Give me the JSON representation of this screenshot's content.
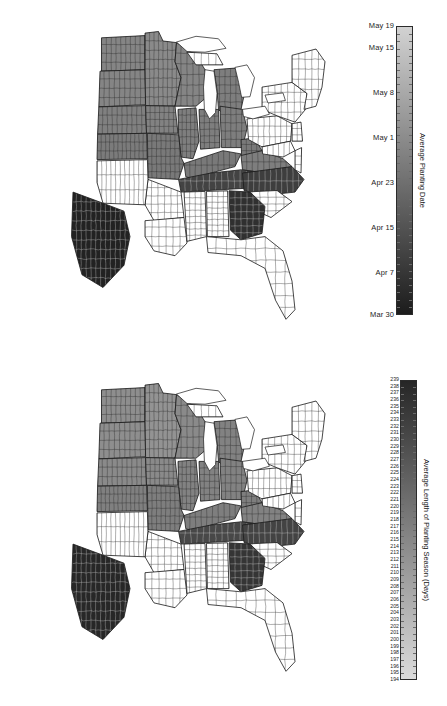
{
  "figure": {
    "background": "#ffffff"
  },
  "panels": [
    {
      "id": "average-planting-date",
      "colorbar": {
        "title": "Average Planting Date",
        "orientation": "vertical",
        "labels": [
          "May 19",
          "May 15",
          "May 8",
          "May 1",
          "Apr 23",
          "Apr 15",
          "Apr 7",
          "Mar 30"
        ],
        "label_positions_pct": [
          0,
          7.6,
          23.2,
          38.7,
          54.3,
          69.9,
          85.5,
          100
        ],
        "top_color": "#d2d2d2",
        "bottom_color": "#1c1c1c",
        "gradient_direction": "light-top-to-dark-bottom",
        "tick_count": 40
      }
    },
    {
      "id": "average-length-of-planting-season",
      "colorbar": {
        "title": "Average Length of Planting Season (Days)",
        "orientation": "vertical",
        "labels": [
          "239",
          "238",
          "237",
          "236",
          "235",
          "234",
          "233",
          "232",
          "231",
          "230",
          "229",
          "228",
          "227",
          "226",
          "225",
          "224",
          "223",
          "222",
          "221",
          "220",
          "219",
          "218",
          "217",
          "216",
          "215",
          "214",
          "213",
          "212",
          "211",
          "210",
          "209",
          "208",
          "207",
          "206",
          "205",
          "204",
          "203",
          "202",
          "201",
          "200",
          "199",
          "198",
          "197",
          "196",
          "195",
          "194"
        ],
        "top_color": "#262626",
        "bottom_color": "#dcdcdc",
        "gradient_direction": "dark-top-to-light-bottom",
        "tick_count": 46
      }
    }
  ],
  "chart_data": {
    "type": "heatmap",
    "title": "",
    "subtitle": "",
    "maps": [
      {
        "name": "Average Planting Date",
        "legend_label": "Average Planting Date",
        "value_type": "date",
        "scale_min_label": "Mar 30",
        "scale_max_label": "May 19",
        "scale_min_color": "#1c1c1c",
        "scale_max_color": "#d2d2d2",
        "tick_labels": [
          "May 19",
          "May 15",
          "May 8",
          "May 1",
          "Apr 23",
          "Apr 15",
          "Apr 7",
          "Mar 30"
        ],
        "regions": [
          {
            "name": "North Dakota",
            "shade": 0.52
          },
          {
            "name": "South Dakota",
            "shade": 0.52
          },
          {
            "name": "Minnesota",
            "shade": 0.5
          },
          {
            "name": "Wisconsin",
            "shade": 0.52
          },
          {
            "name": "Michigan",
            "shade": 0.55
          },
          {
            "name": "Nebraska",
            "shade": 0.54
          },
          {
            "name": "Iowa",
            "shade": 0.53
          },
          {
            "name": "Illinois",
            "shade": 0.55
          },
          {
            "name": "Indiana",
            "shade": 0.55
          },
          {
            "name": "Ohio",
            "shade": 0.55
          },
          {
            "name": "Kansas",
            "shade": 0.56
          },
          {
            "name": "Missouri",
            "shade": 0.57
          },
          {
            "name": "Kentucky",
            "shade": 0.57
          },
          {
            "name": "West Virginia",
            "shade": 0.57
          },
          {
            "name": "Pennsylvania",
            "shade": 0.0
          },
          {
            "name": "New York",
            "shade": 0.0
          },
          {
            "name": "New England",
            "shade": 0.0
          },
          {
            "name": "Virginia",
            "shade": 0.55
          },
          {
            "name": "North Carolina",
            "shade": 0.82
          },
          {
            "name": "Tennessee",
            "shade": 0.8
          },
          {
            "name": "Arkansas",
            "shade": 0.0
          },
          {
            "name": "Oklahoma",
            "shade": 0.0
          },
          {
            "name": "Texas",
            "shade": 0.94
          },
          {
            "name": "Louisiana",
            "shade": 0.0
          },
          {
            "name": "Mississippi",
            "shade": 0.0
          },
          {
            "name": "Alabama",
            "shade": 0.0
          },
          {
            "name": "Georgia",
            "shade": 0.88
          },
          {
            "name": "South Carolina",
            "shade": 0.0
          },
          {
            "name": "Florida",
            "shade": 0.0
          }
        ]
      },
      {
        "name": "Average Length of Planting Season (Days)",
        "legend_label": "Average Length of Planting Season (Days)",
        "value_type": "days",
        "scale_min_label": "194",
        "scale_max_label": "239",
        "scale_min_color": "#dcdcdc",
        "scale_max_color": "#262626",
        "tick_labels": [
          "239",
          "194"
        ],
        "regions": [
          {
            "name": "North Dakota",
            "shade": 0.48
          },
          {
            "name": "South Dakota",
            "shade": 0.48
          },
          {
            "name": "Minnesota",
            "shade": 0.46
          },
          {
            "name": "Wisconsin",
            "shade": 0.5
          },
          {
            "name": "Michigan",
            "shade": 0.53
          },
          {
            "name": "Nebraska",
            "shade": 0.5
          },
          {
            "name": "Iowa",
            "shade": 0.5
          },
          {
            "name": "Illinois",
            "shade": 0.53
          },
          {
            "name": "Indiana",
            "shade": 0.53
          },
          {
            "name": "Ohio",
            "shade": 0.53
          },
          {
            "name": "Kansas",
            "shade": 0.54
          },
          {
            "name": "Missouri",
            "shade": 0.55
          },
          {
            "name": "Kentucky",
            "shade": 0.55
          },
          {
            "name": "West Virginia",
            "shade": 0.55
          },
          {
            "name": "Pennsylvania",
            "shade": 0.0
          },
          {
            "name": "New York",
            "shade": 0.0
          },
          {
            "name": "New England",
            "shade": 0.0
          },
          {
            "name": "Virginia",
            "shade": 0.53
          },
          {
            "name": "North Carolina",
            "shade": 0.8
          },
          {
            "name": "Tennessee",
            "shade": 0.78
          },
          {
            "name": "Arkansas",
            "shade": 0.0
          },
          {
            "name": "Oklahoma",
            "shade": 0.0
          },
          {
            "name": "Texas",
            "shade": 0.92
          },
          {
            "name": "Louisiana",
            "shade": 0.0
          },
          {
            "name": "Mississippi",
            "shade": 0.0
          },
          {
            "name": "Alabama",
            "shade": 0.0
          },
          {
            "name": "Georgia",
            "shade": 0.86
          },
          {
            "name": "South Carolina",
            "shade": 0.0
          },
          {
            "name": "Florida",
            "shade": 0.0
          }
        ]
      }
    ]
  }
}
